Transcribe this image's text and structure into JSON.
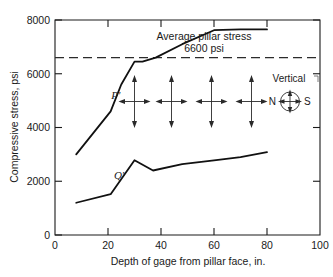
{
  "chart_data": {
    "type": "line",
    "title": "",
    "xlabel": "Depth of gage from pillar face, in.",
    "ylabel": "Compressive stress, psi",
    "xlim": [
      0,
      100
    ],
    "ylim": [
      0,
      8000
    ],
    "xticks": [
      0,
      20,
      40,
      60,
      80,
      100
    ],
    "yticks": [
      0,
      2000,
      4000,
      6000,
      8000
    ],
    "xtick_labels": [
      "0",
      "20",
      "40",
      "60",
      "80",
      "100"
    ],
    "ytick_labels": [
      "0",
      "2000",
      "4000",
      "6000",
      "8000"
    ],
    "grid": false,
    "legend_position": "inline-curve-labels",
    "series": [
      {
        "name": "P'",
        "label": "P'",
        "label_x": 25,
        "label_y": 5050,
        "x": [
          8,
          21,
          25,
          30,
          33,
          38,
          48,
          60,
          70,
          80
        ],
        "values": [
          3000,
          4600,
          5600,
          6450,
          6450,
          6600,
          7100,
          7620,
          7650,
          7650
        ]
      },
      {
        "name": "Q'",
        "label": "Q'",
        "label_x": 26,
        "label_y": 2100,
        "x": [
          8,
          21,
          30,
          37,
          48,
          60,
          70,
          80
        ],
        "values": [
          1200,
          1520,
          2780,
          2400,
          2640,
          2780,
          2900,
          3080
        ]
      }
    ],
    "reference_lines": [
      {
        "name": "average-pillar-stress",
        "orientation": "horizontal",
        "value": 6600,
        "style": "dashed",
        "label_line_1": "Average pillar stress",
        "label_line_2": "6600 psi"
      }
    ],
    "annotations": {
      "stress_crosses": {
        "name": "biaxial-stress-arrow-symbols",
        "count": 4,
        "x_positions": [
          30,
          44,
          59,
          73
        ],
        "y_center": 5000
      },
      "compass": {
        "vertical_label": "Vertical",
        "left_label": "N",
        "right_label": "S",
        "x": 88,
        "y": 5000
      }
    }
  },
  "axis": {
    "y_title": "Compressive stress, psi",
    "x_title": "Depth of gage from pillar face, in."
  },
  "annotation_text": {
    "avg_line_1": "Average pillar stress",
    "avg_line_2": "6600 psi",
    "vertical": "Vertical",
    "north": "N",
    "south": "S",
    "curve_p": "P'",
    "curve_q": "Q'"
  },
  "ticks": {
    "x": [
      "0",
      "20",
      "40",
      "60",
      "80",
      "100"
    ],
    "y": [
      "0",
      "2000",
      "4000",
      "6000",
      "8000"
    ]
  },
  "colors": {
    "curve": "#111111",
    "axis": "#1a1a1a",
    "reference": "#2b2b2b",
    "arrow": "#2a2a2a",
    "background": "#ffffff"
  }
}
